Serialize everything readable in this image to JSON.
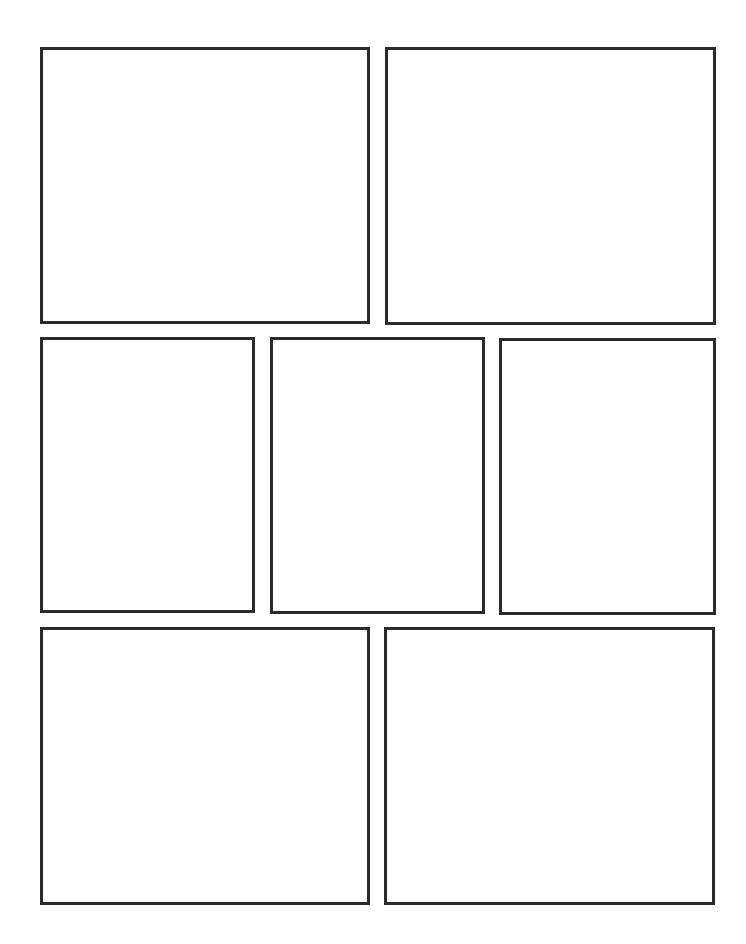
{
  "page": {
    "type": "comic-template",
    "background": "#ffffff",
    "border_color": "#2b2b2b",
    "rows": [
      {
        "panels": [
          {
            "id": "panel-1",
            "x": 40,
            "y": 47,
            "w": 330,
            "h": 277
          },
          {
            "id": "panel-2",
            "x": 385,
            "y": 47,
            "w": 331,
            "h": 278
          }
        ]
      },
      {
        "panels": [
          {
            "id": "panel-3",
            "x": 40,
            "y": 337,
            "w": 215,
            "h": 276
          },
          {
            "id": "panel-4",
            "x": 270,
            "y": 337,
            "w": 215,
            "h": 277
          },
          {
            "id": "panel-5",
            "x": 499,
            "y": 338,
            "w": 217,
            "h": 277
          }
        ]
      },
      {
        "panels": [
          {
            "id": "panel-6",
            "x": 40,
            "y": 627,
            "w": 330,
            "h": 278
          },
          {
            "id": "panel-7",
            "x": 384,
            "y": 627,
            "w": 331,
            "h": 278
          }
        ]
      }
    ]
  }
}
